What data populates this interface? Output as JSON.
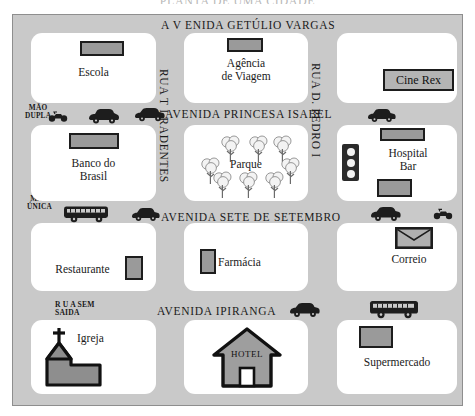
{
  "title": "PLANTA DE UMA CIDADE",
  "streets": {
    "horizontal": [
      {
        "name": "AVENIDA GETÚLIO VARGAS",
        "display": "A V ENIDA GETÚLIO VARGAS"
      },
      {
        "name": "AVENIDA PRINCESA ISABEL",
        "display": "AVENIDA PRINCESA ISABEL"
      },
      {
        "name": "AVENIDA SETE DE SETEMBRO",
        "display": "AVENIDA SETE DE SETEMBRO"
      },
      {
        "name": "AVENIDA IPIRANGA",
        "display": "AVENIDA IPIRANGA"
      }
    ],
    "vertical": [
      {
        "name": "RUA TIRADENTES",
        "display": "RUA  T I RADENTES"
      },
      {
        "name": "RUA D. PEDRO I",
        "display": "RUA  D. PEDRO I"
      }
    ],
    "dead_end": "R U A SEM\nSAIDA"
  },
  "traffic_signs": [
    {
      "id": "mao-dupla",
      "label": "MÃO\nDUPLA"
    },
    {
      "id": "mao-unica",
      "label": "MÃO\nÚNICA"
    }
  ],
  "blocks": [
    {
      "id": "escola",
      "label": "Escola"
    },
    {
      "id": "banco",
      "label": "Banco do\nBrasil"
    },
    {
      "id": "restaurante",
      "label": "Restaurante"
    },
    {
      "id": "igreja",
      "label": "Igreja"
    },
    {
      "id": "agencia",
      "label": "Agência\nde Viagem"
    },
    {
      "id": "parque",
      "label": "Parque"
    },
    {
      "id": "farmacia",
      "label": "Farmácia"
    },
    {
      "id": "hotel",
      "label": "HOTEL"
    },
    {
      "id": "cine-rex",
      "label": "Cine Rex"
    },
    {
      "id": "hospital-bar",
      "label": "Hospital\nBar"
    },
    {
      "id": "correio",
      "label": "Correio"
    },
    {
      "id": "supermercado",
      "label": "Supermercado"
    }
  ],
  "colors": {
    "street": "#c9c9c9",
    "block": "#ffffff",
    "ink": "#1a1a1a",
    "sign_fill": "#9a9a9a",
    "building": "#9e9e9e"
  },
  "counts": {
    "park_trees": 8,
    "traffic_light_lamps": 3
  }
}
